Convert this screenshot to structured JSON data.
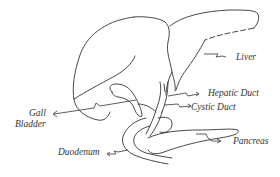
{
  "diagram": {
    "labels": {
      "liver": "Liver",
      "hepatic_duct": "Hepatic Duct",
      "cystic_duct": "Cystic Duct",
      "gall_bladder_line1": "Gall",
      "gall_bladder_line2": "Bladder",
      "duodenum": "Duodenum",
      "pancreas": "Pancreas"
    },
    "colors": {
      "line": "#333333",
      "background": "#ffffff"
    }
  }
}
